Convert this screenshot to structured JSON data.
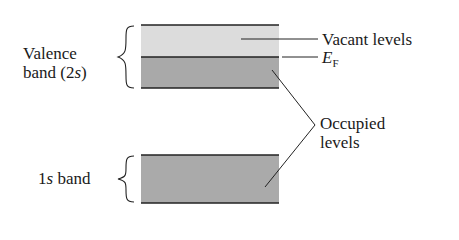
{
  "diagram": {
    "type": "energy-band-diagram",
    "bands": [
      {
        "name": "valence-band-vacant",
        "region": "Vacant levels",
        "fill": "#dcdcdc"
      },
      {
        "name": "valence-band-occupied",
        "region": "Occupied levels",
        "fill": "#a9a9a9"
      },
      {
        "name": "1s-band",
        "region": "Occupied levels",
        "fill": "#aaaaaa"
      }
    ],
    "labels": {
      "valence_line1": "Valence",
      "valence_line2_prefix": "band (2",
      "valence_line2_italic": "s",
      "valence_line2_suffix": ")",
      "band1s_prefix": "1",
      "band1s_italic": "s",
      "band1s_suffix": " band",
      "vacant": "Vacant levels",
      "fermi_main": "E",
      "fermi_sub": "F",
      "occupied_line1": "Occupied",
      "occupied_line2": "levels"
    }
  }
}
